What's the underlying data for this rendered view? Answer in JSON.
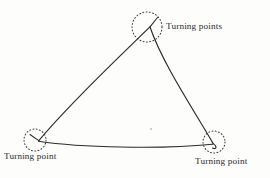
{
  "figure": {
    "background_color": "#fdfdfc",
    "ink_color": "#2b2b2b",
    "labels": {
      "top": "Turning points",
      "bottom_left": "Turning point",
      "bottom_right": "Turning point"
    },
    "markers": [
      {
        "name": "top-turning-point",
        "cx": 147,
        "cy": 27,
        "r": 15,
        "style": "dotted-circle"
      },
      {
        "name": "bottom-left-turning-point",
        "cx": 35,
        "cy": 140,
        "r": 11,
        "style": "dotted-circle"
      },
      {
        "name": "bottom-right-turning-point",
        "cx": 214,
        "cy": 142,
        "r": 11,
        "style": "dotted-circle"
      }
    ],
    "curve": {
      "name": "curvilinear-triangle",
      "description": "Three-cusped closed curve with straight-ish left edge, gently curved right edge, and sagging bottom edge",
      "vertices": [
        {
          "name": "apex",
          "x": 150,
          "y": 26
        },
        {
          "name": "bottom-left-cusp",
          "x": 38,
          "y": 141
        },
        {
          "name": "bottom-right-cusp",
          "x": 213,
          "y": 144
        }
      ],
      "stroke_width": 1.1
    }
  }
}
